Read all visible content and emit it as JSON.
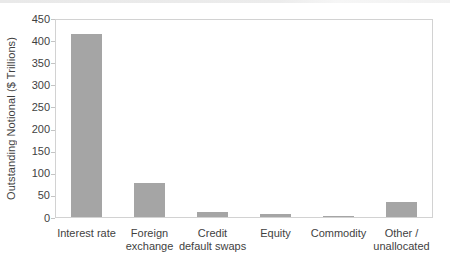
{
  "chart_data": {
    "type": "bar",
    "title": "",
    "xlabel": "",
    "ylabel": "Outstanding Notional ($ Trillions)",
    "categories": [
      "Interest rate",
      "Foreign exchange",
      "Credit default swaps",
      "Equity",
      "Commodity",
      "Other / unallocated"
    ],
    "category_label_lines": [
      [
        "Interest rate"
      ],
      [
        "Foreign",
        "exchange"
      ],
      [
        "Credit",
        "default swaps"
      ],
      [
        "Equity"
      ],
      [
        "Commodity"
      ],
      [
        "Other /",
        "unallocated"
      ]
    ],
    "values": [
      413,
      77,
      11,
      7,
      2,
      34
    ],
    "ylim": [
      0,
      450
    ],
    "yticks": [
      0,
      50,
      100,
      150,
      200,
      250,
      300,
      350,
      400,
      450
    ],
    "grid": false,
    "legend": "none",
    "bar_color": "#a5a5a5",
    "plot_border_color": "#d2d2d2",
    "tick_color": "#c4c4c4",
    "text_color": "#3f3f3f"
  }
}
